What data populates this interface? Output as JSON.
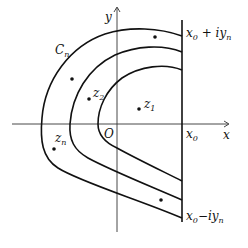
{
  "diagram": {
    "type": "complex-plane contour diagram",
    "axes": {
      "x_label": "x",
      "y_label": "y",
      "origin_label": "O"
    },
    "vertical_line": {
      "foot_label": "x",
      "foot_sub": "0",
      "top_label_main": "x",
      "top_label_sub": "0",
      "top_label_rest": " + iy",
      "top_label_sub2": "n",
      "bottom_label_main": "x",
      "bottom_label_sub": "0",
      "bottom_label_rest": "−iy",
      "bottom_label_sub2": "n"
    },
    "contour_label": {
      "main": "C",
      "sub": "n"
    },
    "points": [
      {
        "main": "z",
        "sub": "1"
      },
      {
        "main": "z",
        "sub": "2"
      },
      {
        "main": "z",
        "sub": "n"
      }
    ],
    "colors": {
      "stroke": "#111111",
      "background": "#ffffff"
    }
  }
}
